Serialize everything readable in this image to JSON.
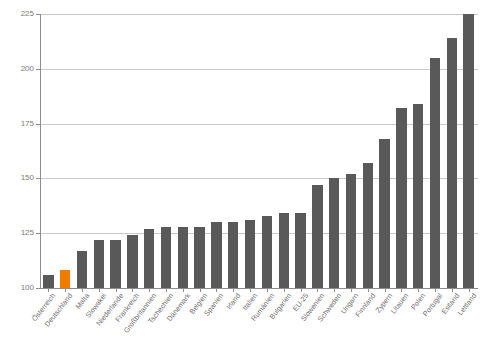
{
  "chart_data": {
    "type": "bar",
    "title": "",
    "subtitle": "",
    "xlabel": "",
    "ylabel": "",
    "ylim": [
      100,
      225
    ],
    "yticks": [
      100,
      125,
      150,
      175,
      200,
      225
    ],
    "ytick_labels": [
      "100",
      "125",
      "150",
      "175",
      "200",
      "225"
    ],
    "grid": true,
    "legend": false,
    "categories": [
      "Österreich",
      "Deutschland",
      "Malta",
      "Slowakei",
      "Niederlande",
      "Frankreich",
      "Großbritannien",
      "Tschechien",
      "Dänemark",
      "Belgien",
      "Spanien",
      "Irland",
      "Italien",
      "Rumänien",
      "Bulgarien",
      "EU-25",
      "Slowenien",
      "Schweden",
      "Ungarn",
      "Finnland",
      "Zypern",
      "Litauen",
      "Polen",
      "Portugal",
      "Estland",
      "Lettland"
    ],
    "values": [
      106,
      108,
      117,
      122,
      122,
      124,
      127,
      128,
      128,
      128,
      130,
      130,
      131,
      133,
      134,
      134,
      147,
      150,
      152,
      157,
      168,
      182,
      184,
      205,
      214,
      225
    ],
    "highlight_category": "Deutschland",
    "colors": {
      "bar": "#595959",
      "highlight_bar": "#f07d00",
      "gridline": "#c9c9c9",
      "axis": "#8d8d8d",
      "tick_label": "#7b7b7b",
      "category_label": "#6e6e6e",
      "background": "#ffffff"
    }
  }
}
